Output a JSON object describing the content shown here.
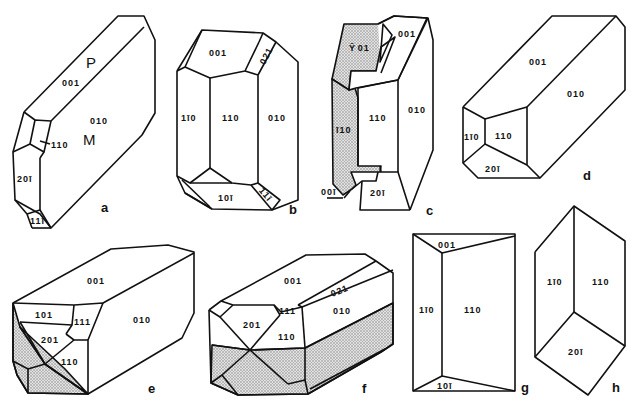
{
  "figure": {
    "panels": [
      {
        "id": "a",
        "letter": "a",
        "faces": [
          "P",
          "001",
          "010",
          "M",
          "110",
          "20ī",
          "11ī"
        ]
      },
      {
        "id": "b",
        "letter": "b",
        "faces": [
          "001",
          "021",
          "1ī0",
          "110",
          "010",
          "10ī",
          "11ī"
        ]
      },
      {
        "id": "c",
        "letter": "c",
        "faces": [
          "̄201",
          "001",
          "ī10",
          "110",
          "010",
          "00ī",
          "20ī"
        ]
      },
      {
        "id": "d",
        "letter": "d",
        "faces": [
          "001",
          "010",
          "1ī0",
          "110",
          "20ī"
        ]
      },
      {
        "id": "e",
        "letter": "e",
        "faces": [
          "001",
          "101",
          "111",
          "010",
          "201",
          "110"
        ]
      },
      {
        "id": "f",
        "letter": "f",
        "faces": [
          "001",
          "021",
          "111",
          "010",
          "201",
          "110"
        ]
      },
      {
        "id": "g",
        "letter": "g",
        "faces": [
          "001",
          "1ī0",
          "110",
          "10ī"
        ]
      },
      {
        "id": "h",
        "letter": "h",
        "faces": [
          "1ī0",
          "110",
          "20ī"
        ]
      }
    ]
  },
  "labels": {
    "a": {
      "P": "P",
      "f001": "001",
      "f010": "010",
      "M": "M",
      "f110": "110",
      "f201": "20ī",
      "f111": "11ī",
      "letter": "a"
    },
    "b": {
      "f001": "001",
      "f021": "021",
      "f1m10": "1ī0",
      "f110": "110",
      "f010": "010",
      "f101": "10ī",
      "f111": "11ī",
      "letter": "b"
    },
    "c": {
      "fm201": "Ȳ 01",
      "f001": "001",
      "fm110": "ī10",
      "f110": "110",
      "f010": "010",
      "f00m1": "00ī",
      "f201": "20ī",
      "letter": "c"
    },
    "d": {
      "f001": "001",
      "f010": "010",
      "f1m10": "1ī0",
      "f110": "110",
      "f201": "20ī",
      "letter": "d"
    },
    "e": {
      "f001": "001",
      "f101": "101",
      "f111": "111",
      "f010": "010",
      "f201": "201",
      "f110": "110",
      "letter": "e"
    },
    "f": {
      "f001": "001",
      "f021": "021",
      "f111": "111",
      "f010": "010",
      "f201": "201",
      "f110": "110",
      "letter": "f"
    },
    "g": {
      "f001": "001",
      "f1m10": "1ī0",
      "f110": "110",
      "f101": "10ī",
      "letter": "g"
    },
    "h": {
      "f1m10": "1ī0",
      "f110": "110",
      "f201": "20ī",
      "letter": "h"
    }
  },
  "colors": {
    "line": "#111111",
    "background": "#ffffff",
    "shading": "#9a9a9a"
  }
}
